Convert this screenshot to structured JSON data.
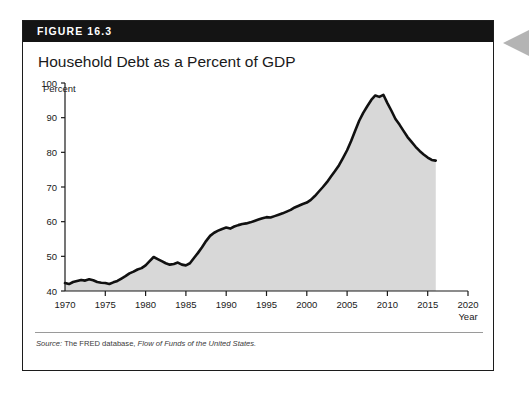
{
  "figure": {
    "badge": "FIGURE 16.3",
    "title": "Household Debt as a Percent of GDP",
    "source_prefix": "Source:",
    "source_roman": " The FRED database, ",
    "source_italic": "Flow of Funds of the United States.",
    "badge_bg": "#141414",
    "border_color": "#1c1c1c",
    "side_tab_color": "#b4b4b4"
  },
  "chart_data": {
    "type": "area",
    "title": "Household Debt as a Percent of GDP",
    "xlabel": "Year",
    "ylabel": "Percent",
    "xlim": [
      1970,
      2020
    ],
    "ylim": [
      40,
      100
    ],
    "xticks": [
      1970,
      1975,
      1980,
      1985,
      1990,
      1995,
      2000,
      2005,
      2010,
      2015,
      2020
    ],
    "yticks": [
      40,
      50,
      60,
      70,
      80,
      90,
      100
    ],
    "grid": false,
    "legend": null,
    "line_color": "#111111",
    "fill_color": "#d8d8d8",
    "series": [
      {
        "name": "Household debt as a percent of GDP",
        "x": [
          1970,
          1970.5,
          1971,
          1971.5,
          1972,
          1972.5,
          1973,
          1973.5,
          1974,
          1974.5,
          1975,
          1975.5,
          1976,
          1976.5,
          1977,
          1977.5,
          1978,
          1978.5,
          1979,
          1979.5,
          1980,
          1980.5,
          1981,
          1981.5,
          1982,
          1982.5,
          1983,
          1983.5,
          1984,
          1984.5,
          1985,
          1985.5,
          1986,
          1986.5,
          1987,
          1987.5,
          1988,
          1988.5,
          1989,
          1989.5,
          1990,
          1990.5,
          1991,
          1991.5,
          1992,
          1992.5,
          1993,
          1993.5,
          1994,
          1994.5,
          1995,
          1995.5,
          1996,
          1996.5,
          1997,
          1997.5,
          1998,
          1998.5,
          1999,
          1999.5,
          2000,
          2000.5,
          2001,
          2001.5,
          2002,
          2002.5,
          2003,
          2003.5,
          2004,
          2004.5,
          2005,
          2005.5,
          2006,
          2006.5,
          2007,
          2007.5,
          2008,
          2008.5,
          2009,
          2009.5,
          2010,
          2010.5,
          2011,
          2011.5,
          2012,
          2012.5,
          2013,
          2013.5,
          2014,
          2014.5,
          2015,
          2015.5,
          2016
        ],
        "values": [
          42.3,
          42.0,
          42.6,
          42.9,
          43.2,
          43.0,
          43.4,
          43.1,
          42.6,
          42.4,
          42.3,
          42.0,
          42.5,
          42.9,
          43.6,
          44.3,
          45.1,
          45.6,
          46.2,
          46.6,
          47.4,
          48.6,
          49.8,
          49.2,
          48.6,
          48.0,
          47.6,
          47.8,
          48.2,
          47.6,
          47.4,
          48.0,
          49.5,
          51.0,
          52.6,
          54.4,
          55.9,
          56.8,
          57.4,
          57.9,
          58.3,
          58.0,
          58.6,
          59.0,
          59.3,
          59.5,
          59.8,
          60.2,
          60.6,
          61.0,
          61.3,
          61.2,
          61.6,
          62.0,
          62.4,
          62.9,
          63.4,
          64.1,
          64.6,
          65.1,
          65.5,
          66.3,
          67.4,
          68.7,
          70.0,
          71.4,
          73.0,
          74.6,
          76.3,
          78.4,
          80.6,
          83.3,
          86.2,
          89.1,
          91.4,
          93.3,
          95.1,
          96.4,
          96.0,
          96.6,
          94.2,
          92.0,
          89.6,
          88.0,
          86.2,
          84.4,
          83.0,
          81.6,
          80.4,
          79.4,
          78.5,
          77.8,
          77.6
        ]
      }
    ]
  }
}
